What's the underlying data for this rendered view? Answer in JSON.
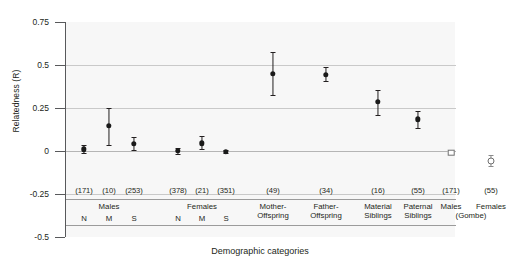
{
  "chart_data": {
    "type": "scatter",
    "title": "",
    "xlabel": "Demographic categories",
    "ylabel": "Relatedness (R)",
    "ylim": [
      -0.5,
      0.75
    ],
    "yticks": [
      "0.75",
      "0.5",
      "0.25",
      "0",
      "-0.25",
      "-0.5"
    ],
    "ytick_values": [
      0.75,
      0.5,
      0.25,
      0,
      -0.25,
      -0.5
    ],
    "grid": "horizontal",
    "legend": "none",
    "categories": [
      "Males N",
      "Males M",
      "Males S",
      "Females N",
      "Females M",
      "Females S",
      "Mother-Offspring",
      "Father-Offspring",
      "Material Siblings",
      "Paternal Siblings",
      "Males (Gombe)",
      "Females (Gombe)"
    ],
    "sample_sizes": [
      "(171)",
      "(10)",
      "(253)",
      "(378)",
      "(21)",
      "(351)",
      "(49)",
      "(34)",
      "(16)",
      "(55)",
      "(171)",
      "(55)"
    ],
    "group_labels": [
      {
        "text": "Males",
        "spans": [
          "N",
          "M",
          "S"
        ]
      },
      {
        "text": "Females",
        "spans": [
          "N",
          "M",
          "S"
        ]
      },
      {
        "text": "Mother-\nOffspring",
        "spans": []
      },
      {
        "text": "Father-\nOffspring",
        "spans": []
      },
      {
        "text": "Material\nSiblings",
        "spans": []
      },
      {
        "text": "Paternal\nSiblings",
        "spans": []
      },
      {
        "text": "Males\n(Gombe)",
        "spans": []
      },
      {
        "text": "Females\n(Gombe)",
        "spans": []
      }
    ],
    "points": [
      {
        "label": "Males N",
        "n": "(171)",
        "value": 0.01,
        "low": -0.01,
        "high": 0.035,
        "marker": "filled-circle"
      },
      {
        "label": "Males M",
        "n": "(10)",
        "value": 0.145,
        "low": 0.035,
        "high": 0.25,
        "marker": "filled-circle"
      },
      {
        "label": "Males S",
        "n": "(253)",
        "value": 0.04,
        "low": 0.005,
        "high": 0.08,
        "marker": "filled-circle"
      },
      {
        "label": "Females N",
        "n": "(378)",
        "value": 0.0,
        "low": -0.015,
        "high": 0.015,
        "marker": "filled-circle"
      },
      {
        "label": "Females M",
        "n": "(21)",
        "value": 0.045,
        "low": 0.01,
        "high": 0.085,
        "marker": "filled-circle"
      },
      {
        "label": "Females S",
        "n": "(351)",
        "value": -0.005,
        "low": -0.012,
        "high": 0.005,
        "marker": "filled-circle"
      },
      {
        "label": "Mother-Offspring",
        "n": "(49)",
        "value": 0.45,
        "low": 0.325,
        "high": 0.575,
        "marker": "filled-circle"
      },
      {
        "label": "Father-Offspring",
        "n": "(34)",
        "value": 0.445,
        "low": 0.405,
        "high": 0.49,
        "marker": "filled-circle"
      },
      {
        "label": "Material Siblings",
        "n": "(16)",
        "value": 0.285,
        "low": 0.21,
        "high": 0.355,
        "marker": "filled-circle"
      },
      {
        "label": "Paternal Siblings",
        "n": "(55)",
        "value": 0.185,
        "low": 0.135,
        "high": 0.235,
        "marker": "filled-circle"
      },
      {
        "label": "Males (Gombe)",
        "n": "(171)",
        "value": -0.01,
        "low": -0.01,
        "high": -0.01,
        "marker": "open-square"
      },
      {
        "label": "Females (Gombe)",
        "n": "(55)",
        "value": -0.055,
        "low": -0.085,
        "high": -0.025,
        "marker": "open-circle"
      }
    ]
  },
  "colors": {
    "plot_background": "#f7f7f7",
    "gridline": "#c9c9c9",
    "axis": "#58595b",
    "marker": "#1a1a1a",
    "marker_open_border": "#6f6f6f",
    "text": "#231f20"
  }
}
